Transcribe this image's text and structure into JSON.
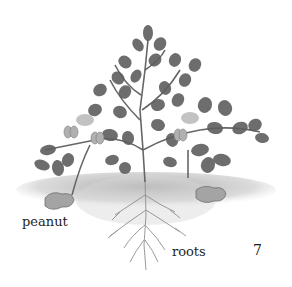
{
  "illustration": {
    "subject": "peanut plant",
    "palette": {
      "leaf_dark": "#5e5e5e",
      "leaf_mid": "#7a7a7a",
      "leaf_light": "#a8a8a8",
      "stem": "#6a6a6a",
      "soil": "#b5b5b5",
      "root": "#8c8c8c",
      "pod": "#a0a0a0"
    }
  },
  "labels": {
    "peanut": "peanut",
    "roots": "roots",
    "page_number": "7"
  }
}
